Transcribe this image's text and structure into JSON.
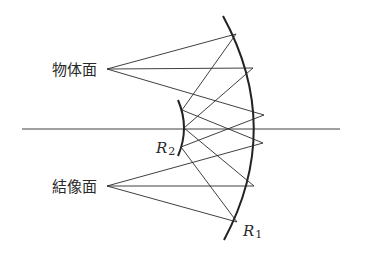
{
  "diagram": {
    "labels": {
      "object_plane": "物体面",
      "image_plane": "結像面",
      "primary_mirror": {
        "main": "R",
        "sub": "1"
      },
      "secondary_mirror": {
        "main": "R",
        "sub": "2"
      }
    },
    "elements": [
      "object-plane-point",
      "image-plane-point",
      "primary-mirror-R1",
      "secondary-mirror-R2",
      "optical-axis",
      "light-rays"
    ]
  }
}
